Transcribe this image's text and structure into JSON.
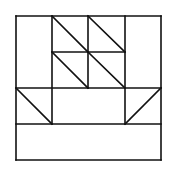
{
  "diagram": {
    "stroke_color": "#111111",
    "background": "#ffffff",
    "grid": {
      "x": [
        16,
        52,
        88,
        125,
        161
      ],
      "y": [
        16,
        52,
        88,
        124,
        160
      ]
    },
    "lines": [
      {
        "x1": 16,
        "y1": 16,
        "x2": 161,
        "y2": 16
      },
      {
        "x1": 16,
        "y1": 160,
        "x2": 161,
        "y2": 160
      },
      {
        "x1": 16,
        "y1": 16,
        "x2": 16,
        "y2": 160
      },
      {
        "x1": 161,
        "y1": 16,
        "x2": 161,
        "y2": 160
      },
      {
        "x1": 52,
        "y1": 16,
        "x2": 52,
        "y2": 124
      },
      {
        "x1": 88,
        "y1": 16,
        "x2": 88,
        "y2": 88
      },
      {
        "x1": 125,
        "y1": 16,
        "x2": 125,
        "y2": 124
      },
      {
        "x1": 52,
        "y1": 52,
        "x2": 125,
        "y2": 52
      },
      {
        "x1": 16,
        "y1": 88,
        "x2": 161,
        "y2": 88
      },
      {
        "x1": 16,
        "y1": 124,
        "x2": 161,
        "y2": 124
      },
      {
        "x1": 52,
        "y1": 16,
        "x2": 88,
        "y2": 52
      },
      {
        "x1": 88,
        "y1": 16,
        "x2": 125,
        "y2": 52
      },
      {
        "x1": 52,
        "y1": 52,
        "x2": 88,
        "y2": 88
      },
      {
        "x1": 88,
        "y1": 52,
        "x2": 125,
        "y2": 88
      },
      {
        "x1": 16,
        "y1": 88,
        "x2": 52,
        "y2": 124
      },
      {
        "x1": 161,
        "y1": 88,
        "x2": 125,
        "y2": 124
      }
    ]
  }
}
